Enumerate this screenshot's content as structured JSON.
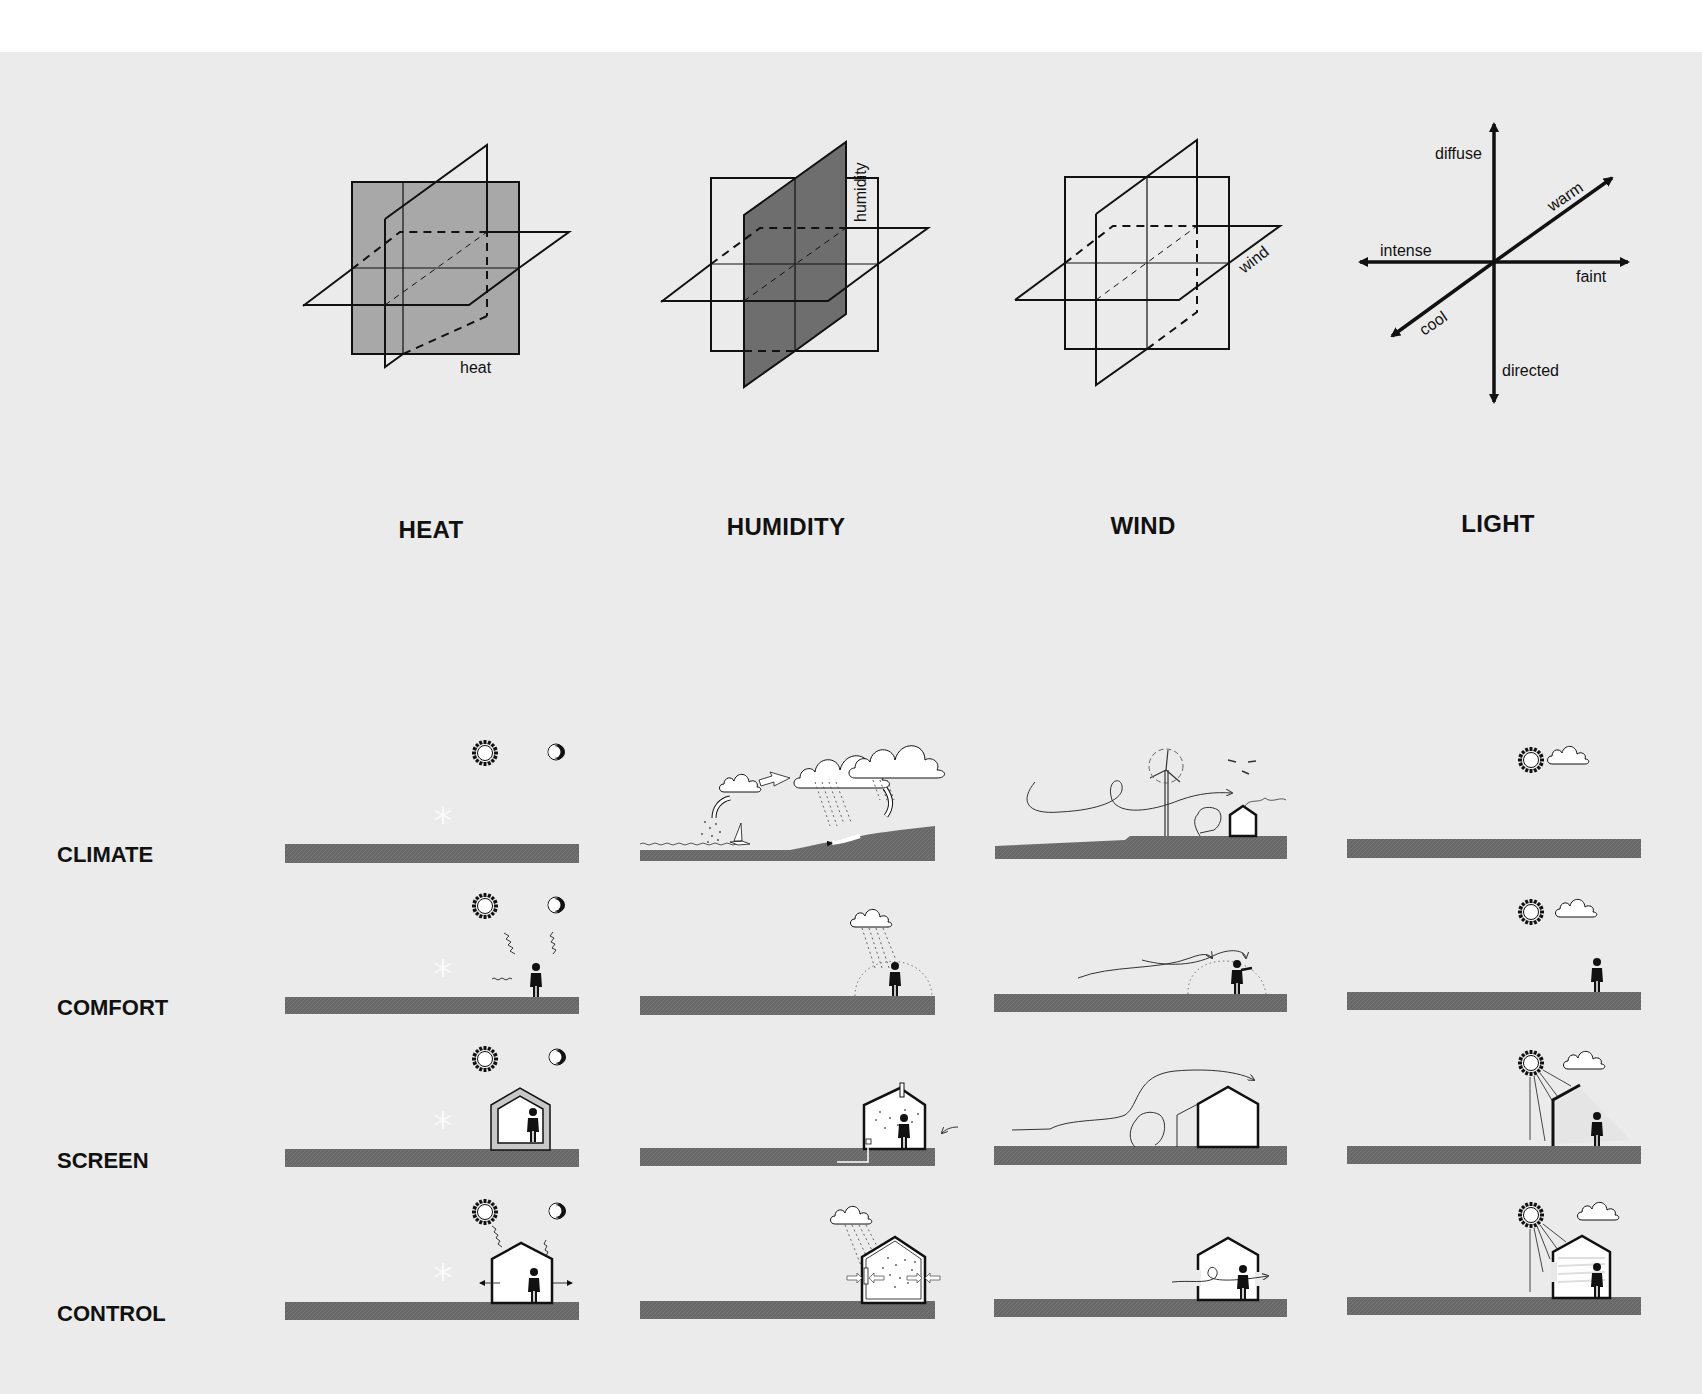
{
  "colors": {
    "background": "#ebebeb",
    "ground": "#6a6a6a",
    "heat_plane": "#a8a8a8",
    "humidity_plane": "#6e6e6e",
    "ink": "#111111"
  },
  "columns": [
    {
      "id": "heat",
      "title": "HEAT",
      "axis_label": "heat"
    },
    {
      "id": "humidity",
      "title": "HUMIDITY",
      "axis_label": "humidity"
    },
    {
      "id": "wind",
      "title": "WIND",
      "axis_label": "wind"
    },
    {
      "id": "light",
      "title": "LIGHT"
    }
  ],
  "light_axes": {
    "up": "diffuse",
    "down": "directed",
    "left": "intense",
    "right": "faint",
    "diag_up": "warm",
    "diag_down": "cool"
  },
  "rows": [
    {
      "id": "climate",
      "label": "CLIMATE"
    },
    {
      "id": "comfort",
      "label": "COMFORT"
    },
    {
      "id": "screen",
      "label": "SCREEN"
    },
    {
      "id": "control",
      "label": "CONTROL"
    }
  ]
}
